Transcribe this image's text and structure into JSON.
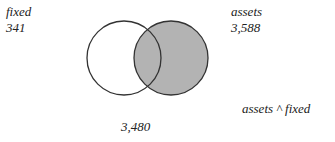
{
  "diagram": {
    "type": "venn",
    "sets": [
      {
        "name": "fixed",
        "count": "341",
        "fill": "#ffffff"
      },
      {
        "name": "assets",
        "count": "3,588",
        "fill": "#b3b3b3"
      }
    ],
    "intersection": {
      "label": "assets ^ fixed",
      "count": "3,480"
    },
    "stroke_color": "#333333"
  }
}
